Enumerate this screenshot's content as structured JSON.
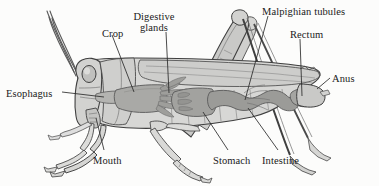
{
  "figure": {
    "background_color": "#fcfcfb",
    "ink_color": "#3a3a3a",
    "label_color": "#1a1a1a",
    "width": 379,
    "height": 186
  },
  "palette": {
    "body_light": "#d8d8d6",
    "body_mid": "#c2c2c0",
    "wing": "#cfcfce",
    "gut_dark": "#9b9b98",
    "gut_mid": "#adadaa",
    "crop": "#a9a9a6",
    "leg_light": "#dcdcda",
    "outline": "#4a4a4a",
    "leader": "#2b2b2b"
  },
  "labels": [
    {
      "id": "esophagus",
      "text": "Esophagus",
      "x": 6,
      "y": 88,
      "align": "left"
    },
    {
      "id": "crop",
      "text": "Crop",
      "x": 102,
      "y": 28,
      "align": "left"
    },
    {
      "id": "digestive_glands_line1",
      "text": "Digestive",
      "x": 148,
      "y": 11,
      "align": "center"
    },
    {
      "id": "digestive_glands_line2",
      "text": "glands",
      "x": 148,
      "y": 22,
      "align": "center"
    },
    {
      "id": "malpighian_tubules",
      "text": "Malpighian tubules",
      "x": 262,
      "y": 6,
      "align": "left"
    },
    {
      "id": "rectum",
      "text": "Rectum",
      "x": 290,
      "y": 29,
      "align": "left"
    },
    {
      "id": "anus",
      "text": "Anus",
      "x": 332,
      "y": 73,
      "align": "left"
    },
    {
      "id": "mouth",
      "text": "Mouth",
      "x": 93,
      "y": 155,
      "align": "left"
    },
    {
      "id": "stomach",
      "text": "Stomach",
      "x": 213,
      "y": 155,
      "align": "left"
    },
    {
      "id": "intestine",
      "text": "Intestine",
      "x": 262,
      "y": 155,
      "align": "left"
    }
  ],
  "anatomy_parts": [
    "esophagus",
    "crop",
    "digestive glands",
    "malpighian tubules",
    "rectum",
    "anus",
    "mouth",
    "stomach",
    "intestine"
  ]
}
